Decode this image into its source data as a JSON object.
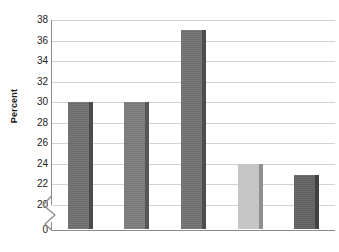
{
  "chart_data": {
    "type": "bar",
    "title": "",
    "subtitle": "",
    "xlabel": "",
    "ylabel": "Percent",
    "categories": [
      "",
      "",
      "",
      "",
      ""
    ],
    "values": [
      30,
      30,
      37,
      24,
      22.9
    ],
    "series": [
      {
        "name": "Percent",
        "values": [
          30,
          30,
          37,
          24,
          22.9
        ]
      }
    ],
    "bar_colors": [
      "#6b6b6b",
      "#787878",
      "#6e6e6e",
      "#c3c3c3",
      "#5f5f5f"
    ],
    "bar_edge_colors": [
      "#4a4a4a",
      "#565656",
      "#4d4d4d",
      "#8f8f8f",
      "#414141"
    ],
    "ylim": [
      20,
      38
    ],
    "y_axis_break": true,
    "y_break_base": 0,
    "yticks": [
      0,
      20,
      22,
      24,
      26,
      28,
      30,
      32,
      34,
      36,
      38
    ],
    "ytick_labels": [
      "0",
      "20",
      "22",
      "24",
      "26",
      "28",
      "30",
      "32",
      "34",
      "36",
      "38"
    ],
    "xticks": [],
    "xtick_labels": [],
    "grid": true,
    "grid_axis": "y",
    "grid_color": "#d2d2d2",
    "legend": false,
    "legend_position": "none",
    "background_color": "#ffffff",
    "axis_color": "#8c8c8c",
    "text_color": "#232323",
    "annotations": []
  }
}
